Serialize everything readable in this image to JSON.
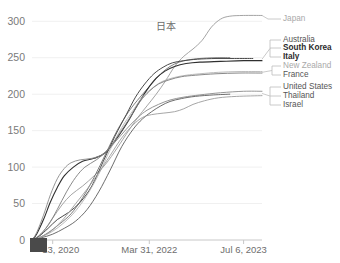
{
  "chart_data": {
    "type": "line",
    "title": "",
    "xlabel": "",
    "ylabel": "",
    "ylim": [
      0,
      310
    ],
    "yticks": [
      0,
      50,
      100,
      150,
      200,
      250,
      300
    ],
    "ytick_labels": [
      "0",
      "50",
      "100",
      "150",
      "200",
      "250",
      "300"
    ],
    "xtick_labels": [
      "13, 2020",
      "Mar 31, 2022",
      "Jul 6, 2023"
    ],
    "xlim_note": "time axis from early 2020 to mid/late 2023",
    "grid": "horizontal",
    "legend_position": "right",
    "annotations": [
      {
        "text": "日本",
        "x_frac": 0.66,
        "y_value": 288
      }
    ],
    "redaction": {
      "present": true,
      "label": "redacted-x-axis-label-prefix"
    },
    "series": [
      {
        "name": "Japan",
        "color": "#9a9a9a",
        "width": 0.9,
        "plateau": 308,
        "points": [
          [
            0,
            0
          ],
          [
            0.02,
            2
          ],
          [
            0.05,
            12
          ],
          [
            0.09,
            30
          ],
          [
            0.13,
            48
          ],
          [
            0.17,
            62
          ],
          [
            0.22,
            74
          ],
          [
            0.27,
            88
          ],
          [
            0.32,
            104
          ],
          [
            0.37,
            126
          ],
          [
            0.42,
            150
          ],
          [
            0.46,
            168
          ],
          [
            0.5,
            184
          ],
          [
            0.54,
            200
          ],
          [
            0.58,
            218
          ],
          [
            0.62,
            238
          ],
          [
            0.66,
            252
          ],
          [
            0.7,
            262
          ],
          [
            0.74,
            274
          ],
          [
            0.78,
            292
          ],
          [
            0.82,
            303
          ],
          [
            0.86,
            307
          ],
          [
            0.92,
            308
          ],
          [
            1.0,
            308
          ]
        ]
      },
      {
        "name": "Australia",
        "color": "#6f6f6f",
        "width": 0.9,
        "plateau": 250,
        "points": [
          [
            0,
            0
          ],
          [
            0.03,
            3
          ],
          [
            0.07,
            10
          ],
          [
            0.12,
            22
          ],
          [
            0.17,
            36
          ],
          [
            0.22,
            58
          ],
          [
            0.27,
            86
          ],
          [
            0.32,
            118
          ],
          [
            0.37,
            150
          ],
          [
            0.42,
            176
          ],
          [
            0.47,
            196
          ],
          [
            0.52,
            214
          ],
          [
            0.56,
            228
          ],
          [
            0.6,
            238
          ],
          [
            0.64,
            244
          ],
          [
            0.68,
            247
          ],
          [
            0.73,
            249
          ],
          [
            0.8,
            250
          ],
          [
            0.86,
            250
          ]
        ]
      },
      {
        "name": "South Korea",
        "color": "#4a4a4a",
        "width": 1.0,
        "plateau": 249,
        "points": [
          [
            0,
            0
          ],
          [
            0.03,
            5
          ],
          [
            0.07,
            16
          ],
          [
            0.11,
            28
          ],
          [
            0.16,
            38
          ],
          [
            0.21,
            52
          ],
          [
            0.26,
            74
          ],
          [
            0.31,
            108
          ],
          [
            0.36,
            142
          ],
          [
            0.41,
            172
          ],
          [
            0.45,
            196
          ],
          [
            0.49,
            214
          ],
          [
            0.53,
            228
          ],
          [
            0.57,
            237
          ],
          [
            0.61,
            243
          ],
          [
            0.66,
            246
          ],
          [
            0.72,
            248
          ],
          [
            0.8,
            249
          ],
          [
            0.88,
            249
          ],
          [
            0.96,
            249
          ]
        ]
      },
      {
        "name": "Italy",
        "color": "#2f2f2f",
        "width": 1.1,
        "plateau": 246,
        "points": [
          [
            0,
            0
          ],
          [
            0.02,
            8
          ],
          [
            0.05,
            28
          ],
          [
            0.08,
            52
          ],
          [
            0.11,
            72
          ],
          [
            0.14,
            88
          ],
          [
            0.18,
            100
          ],
          [
            0.22,
            108
          ],
          [
            0.27,
            112
          ],
          [
            0.32,
            120
          ],
          [
            0.37,
            140
          ],
          [
            0.42,
            164
          ],
          [
            0.46,
            186
          ],
          [
            0.5,
            206
          ],
          [
            0.54,
            222
          ],
          [
            0.58,
            232
          ],
          [
            0.62,
            238
          ],
          [
            0.67,
            242
          ],
          [
            0.73,
            244
          ],
          [
            0.82,
            245
          ],
          [
            0.92,
            246
          ],
          [
            1.0,
            246
          ]
        ]
      },
      {
        "name": "New Zealand",
        "color": "#b3b3b3",
        "width": 0.9,
        "plateau": 231,
        "points": [
          [
            0,
            0
          ],
          [
            0.04,
            4
          ],
          [
            0.09,
            12
          ],
          [
            0.14,
            24
          ],
          [
            0.19,
            40
          ],
          [
            0.24,
            62
          ],
          [
            0.29,
            90
          ],
          [
            0.34,
            124
          ],
          [
            0.39,
            154
          ],
          [
            0.44,
            178
          ],
          [
            0.48,
            196
          ],
          [
            0.53,
            210
          ],
          [
            0.57,
            218
          ],
          [
            0.62,
            223
          ],
          [
            0.67,
            226
          ],
          [
            0.73,
            228
          ],
          [
            0.81,
            230
          ],
          [
            0.9,
            231
          ],
          [
            1.0,
            231
          ]
        ]
      },
      {
        "name": "France",
        "color": "#7d7d7d",
        "width": 0.9,
        "plateau": 229,
        "points": [
          [
            0,
            0
          ],
          [
            0.03,
            6
          ],
          [
            0.07,
            20
          ],
          [
            0.11,
            42
          ],
          [
            0.15,
            66
          ],
          [
            0.19,
            86
          ],
          [
            0.23,
            100
          ],
          [
            0.28,
            110
          ],
          [
            0.33,
            124
          ],
          [
            0.38,
            146
          ],
          [
            0.43,
            170
          ],
          [
            0.47,
            190
          ],
          [
            0.51,
            204
          ],
          [
            0.55,
            214
          ],
          [
            0.6,
            220
          ],
          [
            0.65,
            224
          ],
          [
            0.71,
            226
          ],
          [
            0.8,
            228
          ],
          [
            0.9,
            229
          ],
          [
            1.0,
            229
          ]
        ]
      },
      {
        "name": "United States",
        "color": "#8a8a8a",
        "width": 0.9,
        "plateau": 204,
        "points": [
          [
            0,
            0
          ],
          [
            0.02,
            10
          ],
          [
            0.05,
            34
          ],
          [
            0.08,
            62
          ],
          [
            0.11,
            84
          ],
          [
            0.14,
            98
          ],
          [
            0.17,
            106
          ],
          [
            0.21,
            110
          ],
          [
            0.26,
            112
          ],
          [
            0.31,
            118
          ],
          [
            0.36,
            134
          ],
          [
            0.41,
            152
          ],
          [
            0.46,
            168
          ],
          [
            0.5,
            178
          ],
          [
            0.55,
            186
          ],
          [
            0.6,
            192
          ],
          [
            0.66,
            196
          ],
          [
            0.73,
            199
          ],
          [
            0.82,
            202
          ],
          [
            0.92,
            204
          ],
          [
            1.0,
            204
          ]
        ]
      },
      {
        "name": "Thailand",
        "color": "#5c5c5c",
        "width": 0.9,
        "plateau": 200,
        "points": [
          [
            0,
            0
          ],
          [
            0.04,
            3
          ],
          [
            0.09,
            8
          ],
          [
            0.14,
            16
          ],
          [
            0.19,
            26
          ],
          [
            0.24,
            42
          ],
          [
            0.29,
            66
          ],
          [
            0.34,
            96
          ],
          [
            0.39,
            128
          ],
          [
            0.44,
            152
          ],
          [
            0.48,
            166
          ],
          [
            0.52,
            176
          ],
          [
            0.56,
            184
          ],
          [
            0.6,
            190
          ],
          [
            0.65,
            194
          ],
          [
            0.71,
            197
          ],
          [
            0.79,
            199
          ],
          [
            0.86,
            200
          ]
        ]
      },
      {
        "name": "Israel",
        "color": "#9c9c9c",
        "width": 0.9,
        "plateau": 198,
        "points": [
          [
            0,
            0
          ],
          [
            0.04,
            4
          ],
          [
            0.09,
            14
          ],
          [
            0.14,
            30
          ],
          [
            0.19,
            50
          ],
          [
            0.24,
            70
          ],
          [
            0.29,
            92
          ],
          [
            0.34,
            116
          ],
          [
            0.39,
            140
          ],
          [
            0.44,
            158
          ],
          [
            0.48,
            168
          ],
          [
            0.52,
            172
          ],
          [
            0.57,
            174
          ],
          [
            0.62,
            176
          ],
          [
            0.66,
            180
          ],
          [
            0.7,
            186
          ],
          [
            0.75,
            191
          ],
          [
            0.81,
            195
          ],
          [
            0.89,
            197
          ],
          [
            1.0,
            198
          ]
        ]
      }
    ],
    "legend_entries": [
      {
        "label": "Japan",
        "style": "faint",
        "y": 19
      },
      {
        "label": "Australia",
        "style": "normal",
        "y": 40
      },
      {
        "label": "South Korea",
        "style": "bold",
        "y": 48
      },
      {
        "label": "Italy",
        "style": "bold",
        "y": 57
      },
      {
        "label": "New Zealand",
        "style": "faint",
        "y": 66
      },
      {
        "label": "France",
        "style": "normal",
        "y": 75
      },
      {
        "label": "United States",
        "style": "normal",
        "y": 87
      },
      {
        "label": "Thailand",
        "style": "normal",
        "y": 96
      },
      {
        "label": "Israel",
        "style": "normal",
        "y": 105
      }
    ]
  }
}
